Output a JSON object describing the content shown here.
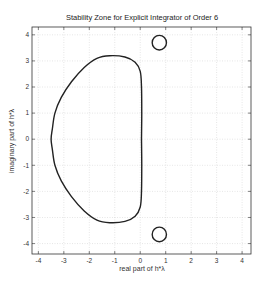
{
  "chart_data": {
    "type": "line",
    "title": "Stability Zone for Explicit Integrator of Order 6",
    "xlabel": "real part of h*λ",
    "ylabel": "imaginary part of h*λ",
    "xlim": [
      -4.25,
      4.35
    ],
    "ylim": [
      -4.4,
      4.3
    ],
    "xticks": [
      -4,
      -3,
      -2,
      -1,
      0,
      1,
      2,
      3,
      4
    ],
    "yticks": [
      -4,
      -3,
      -2,
      -1,
      0,
      1,
      2,
      3,
      4
    ],
    "grid": true,
    "legend": null,
    "series": [
      {
        "name": "main stability boundary",
        "points": [
          [
            0.05,
            0.0
          ],
          [
            0.06,
            1.0
          ],
          [
            0.05,
            2.0
          ],
          [
            0.0,
            2.6
          ],
          [
            -0.2,
            2.95
          ],
          [
            -0.6,
            3.15
          ],
          [
            -1.2,
            3.2
          ],
          [
            -1.7,
            3.1
          ],
          [
            -2.2,
            2.75
          ],
          [
            -2.7,
            2.2
          ],
          [
            -3.1,
            1.6
          ],
          [
            -3.35,
            1.0
          ],
          [
            -3.45,
            0.4
          ],
          [
            -3.5,
            0.0
          ],
          [
            -3.45,
            -0.4
          ],
          [
            -3.35,
            -1.0
          ],
          [
            -3.1,
            -1.6
          ],
          [
            -2.7,
            -2.2
          ],
          [
            -2.2,
            -2.75
          ],
          [
            -1.7,
            -3.1
          ],
          [
            -1.2,
            -3.2
          ],
          [
            -0.6,
            -3.15
          ],
          [
            -0.2,
            -2.95
          ],
          [
            0.0,
            -2.6
          ],
          [
            0.05,
            -2.0
          ],
          [
            0.06,
            -1.0
          ],
          [
            0.05,
            0.0
          ]
        ]
      },
      {
        "name": "upper island",
        "shape": "circle",
        "center": [
          0.75,
          3.7
        ],
        "radius": 0.28
      },
      {
        "name": "lower island",
        "shape": "circle",
        "center": [
          0.75,
          -3.65
        ],
        "radius": 0.28
      }
    ]
  }
}
